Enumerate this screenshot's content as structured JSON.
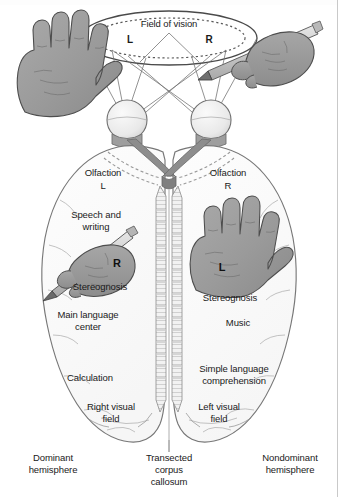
{
  "figure": {
    "type": "anatomical-diagram"
  },
  "vision": {
    "field_label": "Field of vision",
    "left_marker": "L",
    "right_marker": "R"
  },
  "left_hemisphere": {
    "olfaction": "Olfaction",
    "olfaction_side": "L",
    "speech_line1": "Speech and",
    "speech_line2": "writing",
    "hand_letter": "R",
    "stereognosis": "Stereognosis",
    "language_line1": "Main language",
    "language_line2": "center",
    "calculation": "Calculation",
    "visual_field_line1": "Right visual",
    "visual_field_line2": "field",
    "caption_line1": "Dominant",
    "caption_line2": "hemisphere"
  },
  "right_hemisphere": {
    "olfaction": "Olfaction",
    "olfaction_side": "R",
    "hand_letter": "L",
    "stereognosis": "Stereognosis",
    "music": "Music",
    "comprehension_line1": "Simple language",
    "comprehension_line2": "comprehension",
    "visual_field_line1": "Left visual",
    "visual_field_line2": "field",
    "caption_line1": "Nondominant",
    "caption_line2": "hemisphere"
  },
  "center": {
    "callosum_line1": "Transected",
    "callosum_line2": "corpus",
    "callosum_line3": "callosum"
  },
  "icons": {
    "left_hand": "open-left-hand-illustration",
    "right_hand_pencil": "right-hand-holding-pencil-illustration",
    "brain_left_hand_pencil": "left-hemisphere-hand-with-pencil-illustration",
    "brain_right_hand": "right-hemisphere-open-hand-illustration",
    "left_eye": "left-eyeball",
    "right_eye": "right-eyeball",
    "optic_chiasm": "optic-chiasm",
    "corpus_callosum": "transected-corpus-callosum"
  },
  "colors": {
    "ink": "#1a1a1a",
    "outline": "#7d7d7d",
    "brain_fill": "#fbfbfb",
    "hand_fill": "#9a9a9a",
    "hand_outline": "#4c4c4c",
    "chiasm_fill": "#8f8f8f",
    "eye_fill": "#ededed",
    "pencil_fill": "#cfcfcf",
    "background": "#ffffff"
  }
}
